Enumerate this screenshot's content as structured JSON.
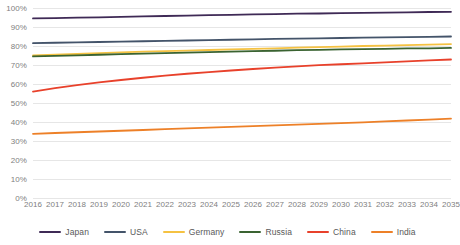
{
  "chart_data": {
    "type": "line",
    "title": "",
    "xlabel": "",
    "ylabel": "",
    "ylim": [
      0,
      100
    ],
    "y_ticks": [
      "0%",
      "10%",
      "20%",
      "30%",
      "40%",
      "50%",
      "60%",
      "70%",
      "80%",
      "90%",
      "100%"
    ],
    "y_tick_values": [
      0,
      10,
      20,
      30,
      40,
      50,
      60,
      70,
      80,
      90,
      100
    ],
    "grid": true,
    "legend_position": "bottom",
    "categories": [
      "2016",
      "2017",
      "2018",
      "2019",
      "2020",
      "2021",
      "2022",
      "2023",
      "2024",
      "2025",
      "2026",
      "2027",
      "2028",
      "2029",
      "2030",
      "2031",
      "2032",
      "2033",
      "2034",
      "2035"
    ],
    "x": [
      2016,
      2017,
      2018,
      2019,
      2020,
      2021,
      2022,
      2023,
      2024,
      2025,
      2026,
      2027,
      2028,
      2029,
      2030,
      2031,
      2032,
      2033,
      2034,
      2035
    ],
    "series": [
      {
        "name": "Japan",
        "color": "#3F2A56",
        "values": [
          94.5,
          94.7,
          94.9,
          95.1,
          95.3,
          95.6,
          95.8,
          96.0,
          96.2,
          96.4,
          96.6,
          96.8,
          97.0,
          97.1,
          97.3,
          97.4,
          97.6,
          97.7,
          97.9,
          98.0
        ]
      },
      {
        "name": "USA",
        "color": "#44546A",
        "values": [
          81.5,
          81.7,
          81.9,
          82.1,
          82.3,
          82.5,
          82.7,
          82.9,
          83.1,
          83.3,
          83.5,
          83.7,
          83.9,
          84.0,
          84.2,
          84.4,
          84.5,
          84.7,
          84.8,
          85.0
        ]
      },
      {
        "name": "Germany",
        "color": "#F5C242",
        "values": [
          75.0,
          75.4,
          75.8,
          76.2,
          76.6,
          77.0,
          77.3,
          77.6,
          77.9,
          78.2,
          78.5,
          78.8,
          79.1,
          79.4,
          79.7,
          80.0,
          80.2,
          80.5,
          80.7,
          81.0
        ]
      },
      {
        "name": "Russia",
        "color": "#3A6331",
        "values": [
          74.5,
          74.8,
          75.1,
          75.4,
          75.7,
          76.0,
          76.3,
          76.5,
          76.8,
          77.0,
          77.3,
          77.5,
          77.8,
          78.0,
          78.2,
          78.4,
          78.5,
          78.7,
          78.8,
          79.0
        ]
      },
      {
        "name": "China",
        "color": "#E8412B",
        "values": [
          56.0,
          57.8,
          59.4,
          60.8,
          62.1,
          63.3,
          64.4,
          65.4,
          66.3,
          67.1,
          67.9,
          68.6,
          69.3,
          69.9,
          70.4,
          70.9,
          71.4,
          71.9,
          72.4,
          72.9
        ]
      },
      {
        "name": "India",
        "color": "#ED8028",
        "values": [
          33.8,
          34.2,
          34.6,
          35.0,
          35.4,
          35.8,
          36.2,
          36.6,
          37.0,
          37.4,
          37.8,
          38.2,
          38.6,
          39.0,
          39.4,
          39.8,
          40.3,
          40.8,
          41.3,
          41.8
        ]
      }
    ]
  },
  "legend": {
    "items": [
      {
        "label": "Japan"
      },
      {
        "label": "USA"
      },
      {
        "label": "Germany"
      },
      {
        "label": "Russia"
      },
      {
        "label": "China"
      },
      {
        "label": "India"
      }
    ]
  }
}
